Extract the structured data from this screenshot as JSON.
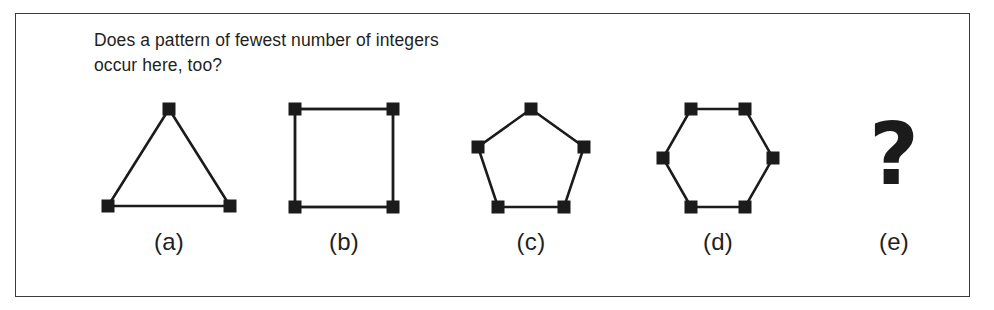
{
  "panel": {
    "border_color": "#3a3a3c",
    "background": "#ffffff"
  },
  "question": {
    "line1": "Does a pattern of fewest number of integers",
    "line2": "occur here, too?"
  },
  "figures": [
    {
      "id": "triangle",
      "label": "(a)",
      "shape": "triangle",
      "sides": 3,
      "vertices": 3,
      "icon": "triangle-icon"
    },
    {
      "id": "square",
      "label": "(b)",
      "shape": "square",
      "sides": 4,
      "vertices": 4,
      "icon": "square-icon"
    },
    {
      "id": "pentagon",
      "label": "(c)",
      "shape": "pentagon",
      "sides": 5,
      "vertices": 5,
      "icon": "pentagon-icon"
    },
    {
      "id": "hexagon",
      "label": "(d)",
      "shape": "hexagon",
      "sides": 6,
      "vertices": 6,
      "icon": "hexagon-icon"
    },
    {
      "id": "unknown",
      "label": "(e)",
      "shape": "question-mark",
      "glyph": "?",
      "icon": "question-mark-icon"
    }
  ],
  "style": {
    "stroke_color": "#1b1b1b",
    "vertex_marker_color": "#1b1b1b",
    "text_color": "#231f20"
  }
}
